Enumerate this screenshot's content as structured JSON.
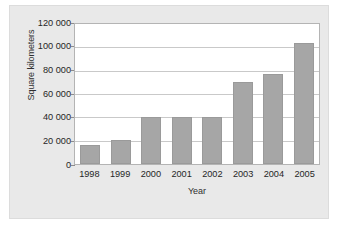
{
  "chart_data": {
    "type": "bar",
    "title": "",
    "xlabel": "Year",
    "ylabel": "Square kilometers",
    "categories": [
      "1998",
      "1999",
      "2000",
      "2001",
      "2002",
      "2003",
      "2004",
      "2005"
    ],
    "values": [
      16000,
      20500,
      40000,
      40000,
      40000,
      70000,
      77000,
      104000
    ],
    "ylim": [
      0,
      120000
    ],
    "ytick_values": [
      120000,
      100000,
      80000,
      60000,
      40000,
      20000,
      0
    ],
    "ytick_labels": [
      "120 000",
      "100 000",
      "80 000",
      "60 000",
      "40 000",
      "20 000",
      "0"
    ],
    "grid": "horizontal",
    "legend": "none",
    "bar_color": "#a6a6a6",
    "plot_background": "#ffffff",
    "figure_background": "#e9e9e9",
    "gridline_color": "#c9c9c9"
  }
}
